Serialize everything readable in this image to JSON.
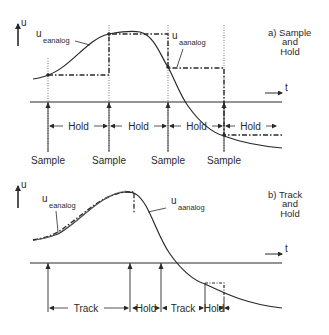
{
  "panel_a": {
    "title_line1": "a) Sample",
    "title_line2": "and",
    "title_line3": "Hold",
    "y_axis_label": "u",
    "x_axis_label": "t",
    "input_label_main": "u",
    "input_label_sub": "eanalog",
    "output_label_main": "u",
    "output_label_sub": "aanalog",
    "intervals": [
      "Hold",
      "Hold",
      "Hold",
      "Hold"
    ],
    "sample_labels": [
      "Sample",
      "Sample",
      "Sample",
      "Sample"
    ]
  },
  "panel_b": {
    "title_line1": "b) Track",
    "title_line2": "and",
    "title_line3": "Hold",
    "y_axis_label": "u",
    "x_axis_label": "t",
    "input_label_main": "u",
    "input_label_sub": "eanalog",
    "output_label_main": "u",
    "output_label_sub": "aanalog",
    "intervals": [
      "Track",
      "Hold",
      "Track",
      "Hold"
    ]
  },
  "colors": {
    "line": "#2a2a2a",
    "background": "#ffffff"
  }
}
